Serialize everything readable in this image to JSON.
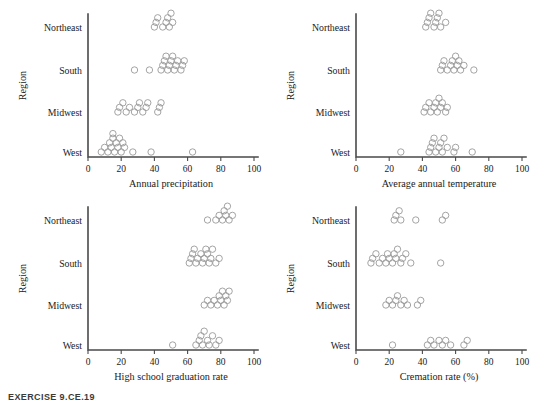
{
  "caption": "EXERCISE 9.CE.19",
  "colors": {
    "axis": "#4a4a4a",
    "marker_stroke": "#9a9a9a",
    "text": "#1a1a1a",
    "background": "#ffffff",
    "caption": "#3b3b3b"
  },
  "shared": {
    "ylabel": "Region",
    "categories": [
      "Northeast",
      "South",
      "Midwest",
      "West"
    ],
    "xticks": [
      0,
      20,
      40,
      60,
      80,
      100
    ],
    "xlim": [
      0,
      100
    ]
  },
  "chart_data": [
    {
      "id": "precipitation",
      "type": "scatter",
      "title": "",
      "xlabel": "Annual precipitation",
      "ylabel": "Region",
      "xlim": [
        0,
        100
      ],
      "xticks": [
        0,
        20,
        40,
        60,
        80,
        100
      ],
      "grid": false,
      "legend": "none",
      "categories": [
        "Northeast",
        "South",
        "Midwest",
        "West"
      ],
      "series": [
        {
          "name": "Northeast",
          "values": [
            40,
            41,
            42,
            45,
            47,
            48,
            49,
            50,
            51
          ]
        },
        {
          "name": "South",
          "values": [
            28,
            37,
            44,
            45,
            46,
            47,
            48,
            49,
            50,
            51,
            52,
            53,
            54,
            56,
            57,
            58
          ]
        },
        {
          "name": "Midwest",
          "values": [
            18,
            19,
            21,
            23,
            25,
            28,
            30,
            31,
            33,
            35,
            36,
            42,
            43,
            44
          ]
        },
        {
          "name": "West",
          "values": [
            8,
            10,
            12,
            13,
            14,
            15,
            15,
            16,
            17,
            18,
            19,
            20,
            21,
            22,
            27,
            38,
            63
          ]
        }
      ]
    },
    {
      "id": "temperature",
      "type": "scatter",
      "title": "",
      "xlabel": "Average annual temperature",
      "ylabel": "Region",
      "xlim": [
        0,
        100
      ],
      "xticks": [
        0,
        20,
        40,
        60,
        80,
        100
      ],
      "grid": false,
      "legend": "none",
      "categories": [
        "Northeast",
        "South",
        "Midwest",
        "West"
      ],
      "series": [
        {
          "name": "Northeast",
          "values": [
            42,
            43,
            44,
            45,
            47,
            48,
            49,
            50,
            51,
            54
          ]
        },
        {
          "name": "South",
          "values": [
            51,
            52,
            53,
            55,
            57,
            58,
            59,
            60,
            61,
            62,
            63,
            65,
            71
          ]
        },
        {
          "name": "Midwest",
          "values": [
            41,
            42,
            44,
            45,
            47,
            48,
            49,
            50,
            51,
            52,
            54,
            55
          ]
        },
        {
          "name": "West",
          "values": [
            27,
            44,
            45,
            46,
            47,
            48,
            50,
            51,
            52,
            53,
            55,
            59,
            60,
            70
          ]
        }
      ]
    },
    {
      "id": "graduation",
      "type": "scatter",
      "title": "",
      "xlabel": "High school graduation rate",
      "ylabel": "Region",
      "xlim": [
        0,
        100
      ],
      "xticks": [
        0,
        20,
        40,
        60,
        80,
        100
      ],
      "grid": false,
      "legend": "none",
      "categories": [
        "Northeast",
        "South",
        "Midwest",
        "West"
      ],
      "series": [
        {
          "name": "Northeast",
          "values": [
            72,
            77,
            79,
            81,
            82,
            83,
            84,
            85,
            87
          ]
        },
        {
          "name": "South",
          "values": [
            61,
            62,
            63,
            64,
            65,
            66,
            68,
            69,
            70,
            71,
            72,
            73,
            74,
            75,
            77,
            79
          ]
        },
        {
          "name": "Midwest",
          "values": [
            70,
            72,
            74,
            76,
            78,
            79,
            80,
            81,
            82,
            83,
            84,
            85
          ]
        },
        {
          "name": "West",
          "values": [
            51,
            65,
            67,
            68,
            69,
            70,
            72,
            73,
            75,
            77,
            79
          ]
        }
      ]
    },
    {
      "id": "cremation",
      "type": "scatter",
      "title": "",
      "xlabel": "Cremation rate (%)",
      "ylabel": "Region",
      "xlim": [
        0,
        100
      ],
      "xticks": [
        0,
        20,
        40,
        60,
        80,
        100
      ],
      "grid": false,
      "legend": "none",
      "categories": [
        "Northeast",
        "South",
        "Midwest",
        "West"
      ],
      "series": [
        {
          "name": "Northeast",
          "values": [
            23,
            24,
            26,
            27,
            36,
            52,
            54
          ]
        },
        {
          "name": "South",
          "values": [
            9,
            10,
            12,
            14,
            16,
            18,
            19,
            20,
            22,
            23,
            24,
            25,
            27,
            28,
            30,
            33,
            51
          ]
        },
        {
          "name": "Midwest",
          "values": [
            18,
            20,
            22,
            24,
            25,
            27,
            29,
            31,
            37,
            39
          ]
        },
        {
          "name": "West",
          "values": [
            22,
            43,
            45,
            47,
            50,
            52,
            54,
            57,
            65,
            67
          ]
        }
      ]
    }
  ]
}
